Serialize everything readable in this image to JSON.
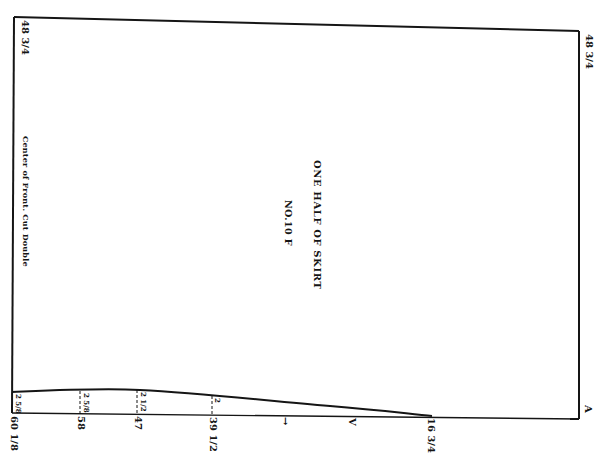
{
  "pattern": {
    "title": "ONE HALF OF SKIRT",
    "number": "NO.10 F",
    "left_edge_label": "Center of Front.  Cut Double",
    "corner_top_left": "48 3/4",
    "corner_top_right": "48 3/4",
    "corner_bottom_right_marker": "A",
    "bottom_measurements": [
      {
        "label": "60 1/8",
        "x": 12
      },
      {
        "label": "58",
        "x": 80
      },
      {
        "label": "47",
        "x": 137
      },
      {
        "label": "39 1/2",
        "x": 212
      },
      {
        "label": "16 3/4",
        "x": 430
      }
    ],
    "seam_measurements": [
      {
        "label": "2 5/8",
        "x": 12
      },
      {
        "label": "2 5/8",
        "x": 80
      },
      {
        "label": "2 1/2",
        "x": 137
      },
      {
        "label": "2",
        "x": 212
      }
    ],
    "grain_markers": [
      {
        "symbol": "→",
        "x": 283
      },
      {
        "symbol": "V",
        "x": 350
      }
    ],
    "line_color": "#151515"
  }
}
